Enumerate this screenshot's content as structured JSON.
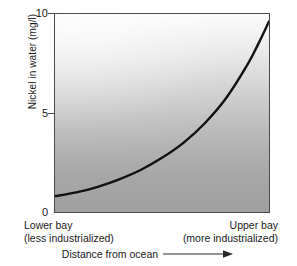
{
  "chart_data": {
    "type": "line",
    "title": "",
    "subtitle": "",
    "xlabel": "Distance from ocean",
    "ylabel": "Nickel in water (mg/l)",
    "xlim": [
      0,
      1
    ],
    "ylim": [
      0,
      10.6
    ],
    "grid": false,
    "legend": "none",
    "y_ticks": [
      "0",
      "5",
      "10"
    ],
    "y_tick_values": [
      0,
      5,
      10
    ],
    "x_category_labels": [
      {
        "line1": "Lower bay",
        "line2": "(less industrialized)",
        "position": "left"
      },
      {
        "line1": "Upper bay",
        "line2": "(more industrialized)",
        "position": "right"
      }
    ],
    "x_axis_arrow": "arrow-right",
    "series": [
      {
        "name": "Nickel concentration",
        "color": "#111111",
        "x": [
          0.0,
          0.1,
          0.2,
          0.3,
          0.4,
          0.5,
          0.6,
          0.7,
          0.8,
          0.9,
          0.95,
          1.0
        ],
        "y": [
          0.85,
          1.05,
          1.35,
          1.75,
          2.25,
          2.9,
          3.7,
          4.75,
          6.1,
          7.9,
          9.0,
          10.2
        ]
      }
    ],
    "annotations": [],
    "background": {
      "gradient_from": "#fbfbfb",
      "gradient_to": "#a0a0a0",
      "gradient_direction": "top-left-light-to-bottom-dark"
    },
    "frame_color": "#4a4a4a",
    "axis_label_color": "#1a1a1a"
  }
}
